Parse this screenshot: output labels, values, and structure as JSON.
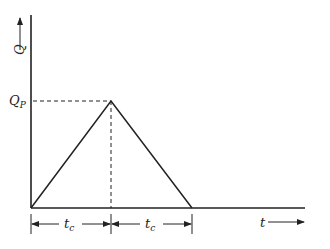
{
  "diagram": {
    "type": "triangular hydrograph",
    "y_axis_label": "Q",
    "peak_label_main": "Q",
    "peak_label_sub": "P",
    "x_axis_label": "t",
    "interval_label_main": "t",
    "interval_label_sub": "c",
    "colors": {
      "line": "#222222",
      "background": "#ffffff"
    }
  }
}
